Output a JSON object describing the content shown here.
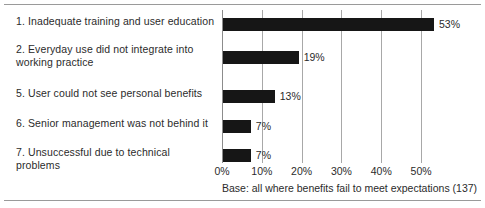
{
  "chart_data": {
    "type": "bar",
    "orientation": "horizontal",
    "title": "",
    "subtitle": "",
    "xlabel": "",
    "ylabel": "",
    "xlim": [
      0,
      55
    ],
    "grid": "vertical",
    "legend": "none",
    "categories": [
      "1. Inadequate training and user education",
      "2. Everyday use did not integrate into\n    working practice",
      "5. User could not see personal benefits",
      "6. Senior management was not behind it",
      "7. Unsuccessful due to technical problems"
    ],
    "values": [
      53,
      19,
      13,
      7,
      7
    ],
    "data_labels": [
      "53%",
      "19%",
      "13%",
      "7%",
      "7%"
    ],
    "tick_values": [
      0,
      10,
      20,
      30,
      40,
      50
    ],
    "tick_labels": [
      "0%",
      "10%",
      "20%",
      "30%",
      "40%",
      "50%"
    ],
    "annotation": "Base: all where benefits fail to meet expectations (137)",
    "bar_color": "#161616",
    "gridline_color": "#a8a8a8",
    "text_color": "#2b2b2b",
    "rule_color": "#9a9a9a",
    "background_color": "#ffffff"
  }
}
